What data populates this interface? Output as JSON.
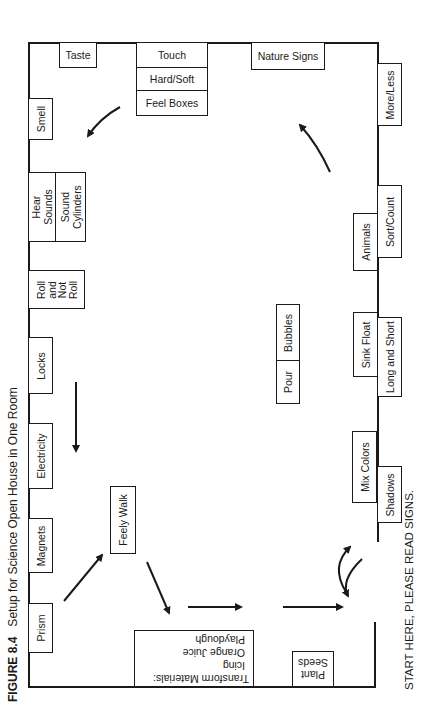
{
  "figure": {
    "number": "FIGURE 8.4",
    "title": "Setup for Science Open House in One Room"
  },
  "start_note": "START HERE, PLEASE READ SIGNS.",
  "stations": {
    "taste": "Taste",
    "touch": "Touch",
    "hard_soft": "Hard/Soft",
    "feel_boxes": "Feel Boxes",
    "nature_signs": "Nature Signs",
    "more_less": "More/Less",
    "smell": "Smell",
    "hear_sounds": "Hear Sounds",
    "sound_cylinders": "Sound Cylinders",
    "roll_and_not_roll": "Roll and Not Roll",
    "locks": "Locks",
    "electricity": "Electricity",
    "magnets": "Magnets",
    "prism": "Prism",
    "feely_walk": "Feely Walk",
    "bubbles": "Bubbles",
    "pour": "Pour",
    "animals": "Animals",
    "sort_count": "Sort/Count",
    "sink_float": "Sink Float",
    "long_and_short": "Long and Short",
    "mix_colors": "Mix Colors",
    "shadows": "Shadows",
    "plant_seeds": "Plant Seeds",
    "transform_materials": {
      "heading": "Transform Materials:",
      "items": [
        "Icing",
        "Orange Juice",
        "Playdough"
      ]
    }
  }
}
